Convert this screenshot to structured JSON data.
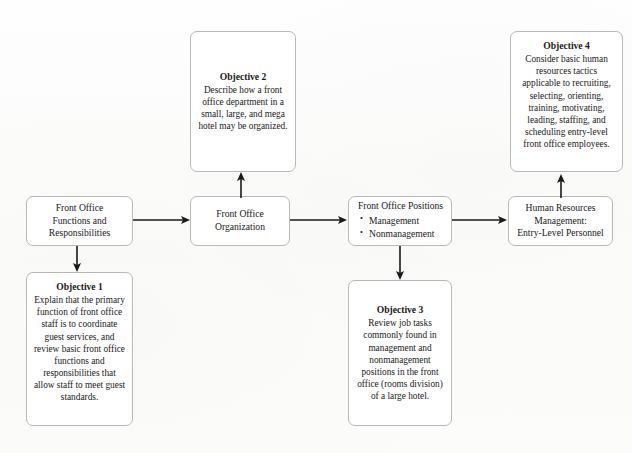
{
  "diagram": {
    "type": "flowchart",
    "background_color": "#fdfdfc",
    "box_border_color": "#b9b9b9",
    "text_color": "#181818",
    "flow_nodes": [
      {
        "id": "front-office-functions",
        "lines": [
          "Front Office",
          "Functions and",
          "Responsibilities"
        ]
      },
      {
        "id": "front-office-organization",
        "lines": [
          "Front Office",
          "Organization"
        ]
      },
      {
        "id": "front-office-positions",
        "lead": "Front Office Positions",
        "bullets": [
          "Management",
          "Nonmanagement"
        ]
      },
      {
        "id": "human-resources-management",
        "lines": [
          "Human Resources",
          "Management:",
          "Entry-Level Personnel"
        ]
      }
    ],
    "objectives": [
      {
        "id": "objective-1",
        "title": "Objective 1",
        "body": "Explain that the primary function of front office staff is to coordinate guest services, and review basic front office functions and responsibilities that allow staff to meet guest standards."
      },
      {
        "id": "objective-2",
        "title": "Objective 2",
        "body": "Describe how a front office department in a small, large, and mega hotel may be organized."
      },
      {
        "id": "objective-3",
        "title": "Objective 3",
        "body": "Review job tasks commonly found in management and nonmanagement positions in the front office (rooms division) of a large hotel."
      },
      {
        "id": "objective-4",
        "title": "Objective 4",
        "body": "Consider basic human resources tactics applicable to recruiting, selecting, orienting, training, motivating, leading, staffing, and scheduling entry-level front office employees."
      }
    ],
    "connectors": [
      {
        "id": "functions-to-organization",
        "direction": "right"
      },
      {
        "id": "organization-to-positions",
        "direction": "right"
      },
      {
        "id": "positions-to-human-resources",
        "direction": "right"
      },
      {
        "id": "functions-to-objective-1",
        "direction": "down"
      },
      {
        "id": "organization-to-objective-2",
        "direction": "up"
      },
      {
        "id": "positions-to-objective-3",
        "direction": "down"
      },
      {
        "id": "human-resources-to-objective-4",
        "direction": "up"
      }
    ]
  }
}
